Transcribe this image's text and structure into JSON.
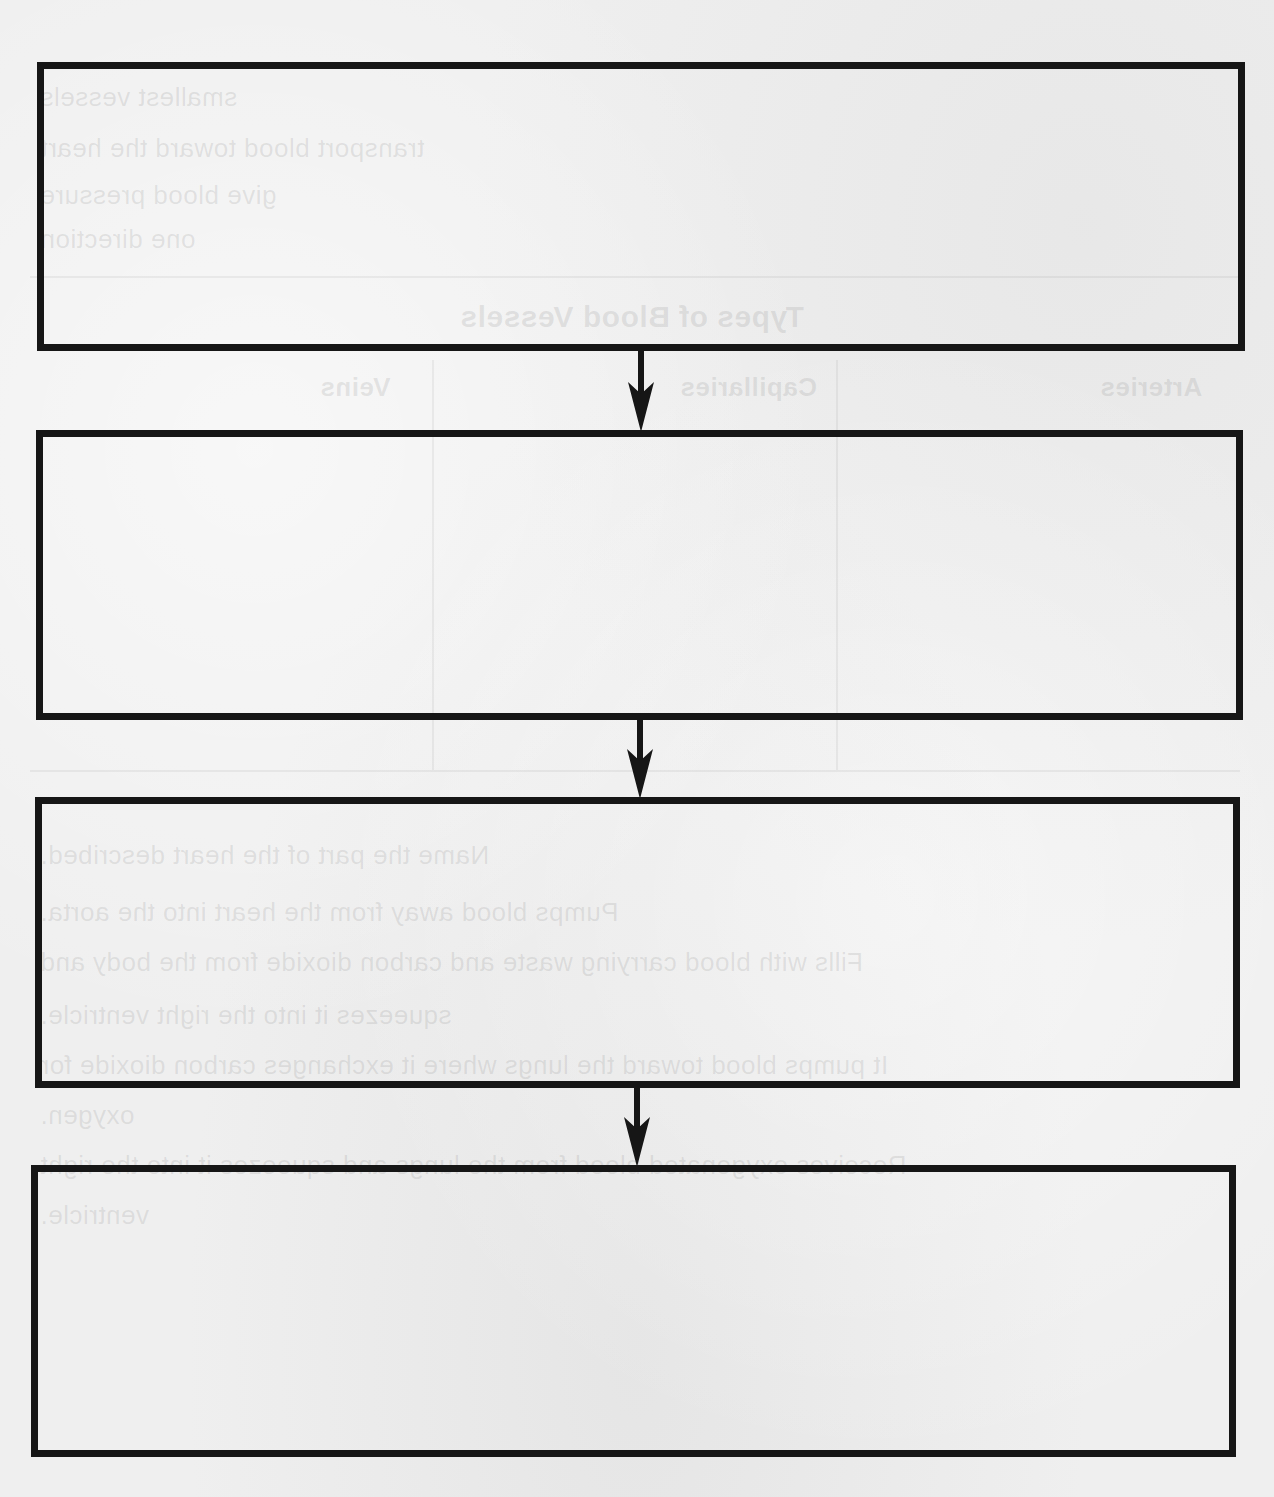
{
  "diagram": {
    "type": "vertical-flowchart",
    "orientation": "top-to-bottom",
    "border_color": "#161616",
    "background_color": "#efefef",
    "boxes": [
      {
        "id": "box-1",
        "label": "",
        "x": 37,
        "y": 62,
        "width": 1208,
        "height": 289
      },
      {
        "id": "box-2",
        "label": "",
        "x": 36,
        "y": 430,
        "width": 1207,
        "height": 290
      },
      {
        "id": "box-3",
        "label": "",
        "x": 35,
        "y": 797,
        "width": 1205,
        "height": 291
      },
      {
        "id": "box-4",
        "label": "",
        "x": 31,
        "y": 1165,
        "width": 1205,
        "height": 292
      }
    ],
    "arrows": [
      {
        "from": "box-1",
        "to": "box-2",
        "direction": "down"
      },
      {
        "from": "box-2",
        "to": "box-3",
        "direction": "down"
      },
      {
        "from": "box-3",
        "to": "box-4",
        "direction": "down"
      }
    ]
  },
  "bleed_through": {
    "lines": [
      "smallest vessels",
      "transport blood toward the heart",
      "give blood pressure",
      "one direction",
      "Types of Blood Vessels",
      "Arteries",
      "Capillaries",
      "Veins",
      "Name the part of the heart described.",
      "Pumps blood away from the heart into the aorta.",
      "Fills with blood carrying waste and carbon dioxide from the body and",
      "squeezes it into the right ventricle.",
      "It pumps blood toward the lungs where it exchanges carbon dioxide for",
      "oxygen.",
      "Receives oxygenated blood from the lungs and squeezes it into the right",
      "ventricle."
    ]
  }
}
